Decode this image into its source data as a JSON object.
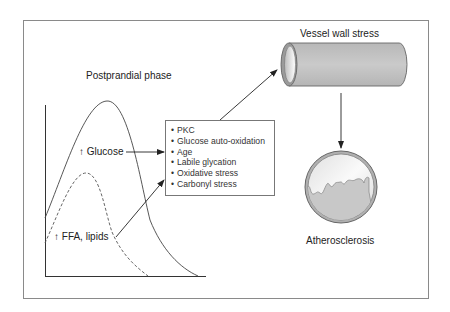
{
  "diagram": {
    "phase_title": "Postprandial phase",
    "glucose_label": "↑ Glucose",
    "ffa_label": "↑ FFA, lipids",
    "mechanisms": [
      "PKC",
      "Glucose auto-oxidation",
      "Age",
      "Labile glycation",
      "Oxidative stress",
      "Carbonyl stress"
    ],
    "vessel_label": "Vessel wall stress",
    "outcome_label": "Atherosclerosis",
    "colors": {
      "frame": "#8a8a8a",
      "tube_fill": "#c4c4c4",
      "plaque_fill": "#c8c8c8",
      "line": "#333333"
    }
  }
}
